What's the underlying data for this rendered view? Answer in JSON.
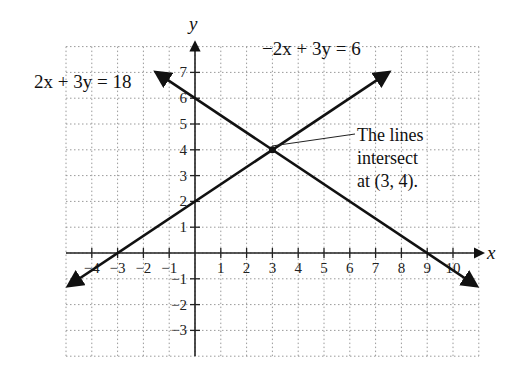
{
  "chart_data": {
    "type": "line",
    "title": "",
    "xlabel": "x",
    "ylabel": "y",
    "xlim": [
      -5,
      11
    ],
    "ylim": [
      -4,
      8
    ],
    "grid": true,
    "x_ticks": [
      -4,
      -3,
      -2,
      -1,
      1,
      2,
      3,
      4,
      5,
      6,
      7,
      8,
      9,
      10
    ],
    "y_ticks": [
      -3,
      -2,
      -1,
      1,
      2,
      3,
      4,
      5,
      6,
      7
    ],
    "series": [
      {
        "name": "2x + 3y = 18",
        "equation": "2x + 3y = 18",
        "points": [
          [
            -1.5,
            7
          ],
          [
            0,
            6
          ],
          [
            3,
            4
          ],
          [
            9,
            0
          ],
          [
            10.9,
            -1.27
          ]
        ]
      },
      {
        "name": "-2x + 3y = 6",
        "equation": "-2x + 3y = 6",
        "points": [
          [
            -4.9,
            -1.27
          ],
          [
            -3,
            0
          ],
          [
            0,
            2
          ],
          [
            3,
            4
          ],
          [
            7.5,
            7
          ]
        ]
      }
    ],
    "intersection": [
      3,
      4
    ],
    "annotations": [
      "2x + 3y = 18",
      "−2x + 3y = 6",
      "The lines",
      "intersect",
      "at (3, 4)."
    ]
  },
  "labels": {
    "eq1": "2x + 3y = 18",
    "eq2": "−2x + 3y = 6",
    "note_line1": "The lines",
    "note_line2": "intersect",
    "note_line3": "at (3, 4).",
    "x_axis": "x",
    "y_axis": "y"
  },
  "colors": {
    "line": "#111111",
    "grid": "#9a9a9a",
    "axis": "#222222"
  }
}
